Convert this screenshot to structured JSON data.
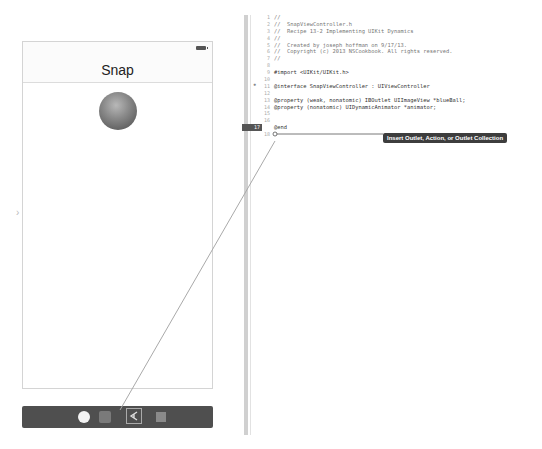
{
  "storyboard": {
    "nav_title": "Snap",
    "dock_icons": [
      "view-controller-icon",
      "first-responder-icon",
      "exit-icon",
      "segue-icon"
    ]
  },
  "editor": {
    "line_numbers": [
      "1",
      "2",
      "3",
      "4",
      "5",
      "6",
      "7",
      "8",
      "9",
      "10",
      "11",
      "12",
      "13",
      "14",
      "15",
      "16",
      "17",
      "18"
    ],
    "active_line": "17",
    "lines": [
      "//",
      "//  SnapViewController.h",
      "//  Recipe 13-2 Implementing UIKit Dynamics",
      "//",
      "//  Created by joseph hoffman on 9/17/13.",
      "//  Copyright (c) 2013 NSCookbook. All rights reserved.",
      "//",
      "",
      "#import <UIKit/UIKit.h>",
      "",
      "@interface SnapViewController : UIViewController",
      "",
      "@property (weak, nonatomic) IBOutlet UIImageView *blueBall;",
      "@property (nonatomic) UIDynamicAnimator *animator;",
      "",
      "",
      "@end",
      ""
    ]
  },
  "tooltip": {
    "text": "Insert Outlet, Action, or Outlet Collection"
  }
}
